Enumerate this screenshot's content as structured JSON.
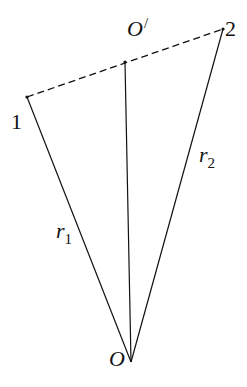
{
  "diagram": {
    "type": "geometry",
    "background": "#ffffff",
    "stroke_color": "#111111",
    "points": {
      "p1": {
        "label": "1",
        "x": 27,
        "y": 97
      },
      "p2": {
        "label": "2",
        "x": 223,
        "y": 29
      },
      "o_prime": {
        "label": "O",
        "prime": "/",
        "x": 125,
        "y": 62
      },
      "o": {
        "label": "O",
        "x": 131,
        "y": 362
      }
    },
    "segments": [
      {
        "name": "r1",
        "from": "o",
        "to": "p1",
        "style": "solid",
        "label": "r",
        "subscript": "1"
      },
      {
        "name": "r2",
        "from": "o",
        "to": "p2",
        "style": "solid",
        "label": "r",
        "subscript": "2"
      },
      {
        "name": "o-to-o-prime",
        "from": "o",
        "to": "o_prime",
        "style": "solid"
      },
      {
        "name": "p1-to-p2",
        "from": "p1",
        "to": "p2",
        "style": "dashed"
      }
    ],
    "labels": {
      "point1": "1",
      "point2": "2",
      "o_prime_main": "O",
      "o_prime_mark": "/",
      "origin": "O",
      "r1_main": "r",
      "r1_sub": "1",
      "r2_main": "r",
      "r2_sub": "2"
    }
  }
}
